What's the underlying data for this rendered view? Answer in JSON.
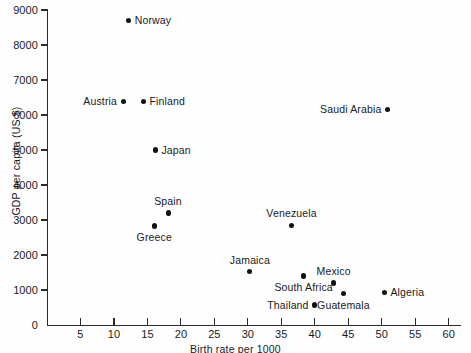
{
  "chart_data": {
    "type": "scatter",
    "title": "",
    "xlabel": "Birth rate per 1000",
    "ylabel": "GDP per capita (US $)",
    "xlim": [
      0,
      62
    ],
    "ylim": [
      0,
      9000
    ],
    "xticks": [
      5,
      10,
      15,
      20,
      25,
      30,
      35,
      40,
      45,
      50,
      55,
      60
    ],
    "yticks": [
      0,
      1000,
      2000,
      3000,
      4000,
      5000,
      6000,
      7000,
      8000,
      9000
    ],
    "xtick_labels": [
      "5",
      "10",
      "15",
      "20",
      "25",
      "30",
      "35",
      "40",
      "45",
      "50",
      "55",
      "60"
    ],
    "ytick_labels": [
      "0",
      "1000",
      "2000",
      "3000",
      "4000",
      "5000",
      "6000",
      "7000",
      "8000",
      "9000"
    ],
    "grid": false,
    "legend": false,
    "marker_color": "#111111",
    "axis_color": "#2b2b2b",
    "points": [
      {
        "name": "Norway",
        "x": 12.2,
        "y": 8700,
        "label_side": "right"
      },
      {
        "name": "Austria",
        "x": 11.4,
        "y": 6380,
        "label_side": "left"
      },
      {
        "name": "Finland",
        "x": 14.4,
        "y": 6380,
        "label_side": "right"
      },
      {
        "name": "Saudi Arabia",
        "x": 50.8,
        "y": 6150,
        "label_side": "left"
      },
      {
        "name": "Japan",
        "x": 16.2,
        "y": 5000,
        "label_side": "right"
      },
      {
        "name": "Spain",
        "x": 18.1,
        "y": 3200,
        "label_side": "above"
      },
      {
        "name": "Greece",
        "x": 16.0,
        "y": 2830,
        "label_side": "below"
      },
      {
        "name": "Venezuela",
        "x": 36.5,
        "y": 2850,
        "label_side": "above"
      },
      {
        "name": "Jamaica",
        "x": 30.3,
        "y": 1520,
        "label_side": "above"
      },
      {
        "name": "South Africa",
        "x": 38.3,
        "y": 1400,
        "label_side": "below"
      },
      {
        "name": "Mexico",
        "x": 42.8,
        "y": 1200,
        "label_side": "above"
      },
      {
        "name": "Algeria",
        "x": 50.4,
        "y": 920,
        "label_side": "right"
      },
      {
        "name": "Guatemala",
        "x": 44.3,
        "y": 900,
        "label_side": "below"
      },
      {
        "name": "Thailand",
        "x": 39.9,
        "y": 570,
        "label_side": "left"
      }
    ]
  }
}
